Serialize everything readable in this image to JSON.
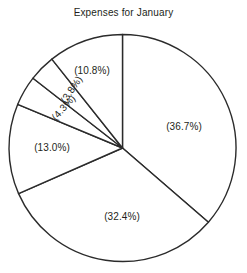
{
  "chart_data": {
    "type": "pie",
    "title": "Expenses for January",
    "xlabel": "",
    "ylabel": "",
    "legend": "none",
    "grid": false,
    "start_angle_deg": 90,
    "direction": "clockwise",
    "label_format": "(value%)",
    "categories": [
      "Slice 1",
      "Slice 2",
      "Slice 3",
      "Slice 4",
      "Slice 5",
      "Slice 6"
    ],
    "values": [
      36.7,
      32.4,
      13.0,
      4.3,
      3.8,
      10.8
    ],
    "labels": [
      "(36.7%)",
      "(32.4%)",
      "(13.0%)",
      "(4.3%)",
      "(3.8%)",
      "(10.8%)"
    ],
    "slices": [
      {
        "label": "(36.7%)",
        "value": 36.7,
        "label_x": 184,
        "label_y": 127,
        "label_rotation": 0,
        "anchor": "middle"
      },
      {
        "label": "(32.4%)",
        "value": 32.4,
        "label_x": 122,
        "label_y": 217,
        "label_rotation": 0,
        "anchor": "middle"
      },
      {
        "label": "(13.0%)",
        "value": 13.0,
        "label_x": 52,
        "label_y": 148,
        "label_rotation": 0,
        "anchor": "middle"
      },
      {
        "label": "(4.3%)",
        "value": 4.3,
        "label_x": 64,
        "label_y": 108,
        "label_rotation": -48,
        "anchor": "middle"
      },
      {
        "label": "(3.8%)",
        "value": 3.8,
        "label_x": 72,
        "label_y": 90,
        "label_rotation": -56,
        "anchor": "middle"
      },
      {
        "label": "(10.8%)",
        "value": 10.8,
        "label_x": 92,
        "label_y": 71,
        "label_rotation": 0,
        "anchor": "middle"
      }
    ],
    "geometry": {
      "center_x": 122.5,
      "center_y": 148,
      "radius": 113.5
    },
    "colors": {
      "slice_fill": "#ffffff",
      "slice_stroke": "#2b2b2b",
      "text": "#231f20",
      "background": "#ffffff"
    }
  }
}
